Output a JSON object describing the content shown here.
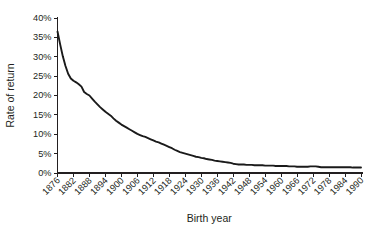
{
  "chart_data": {
    "type": "line",
    "title": "",
    "xlabel": "Birth year",
    "ylabel": "Rate of return",
    "xlim": [
      1876,
      1990
    ],
    "ylim": [
      0,
      40
    ],
    "ytick_labels": [
      "0%",
      "5%",
      "10%",
      "15%",
      "20%",
      "25%",
      "30%",
      "35%",
      "40%"
    ],
    "ytick_values": [
      0,
      5,
      10,
      15,
      20,
      25,
      30,
      35,
      40
    ],
    "xtick_labels": [
      "1876",
      "1882",
      "1888",
      "1894",
      "1900",
      "1906",
      "1912",
      "1918",
      "1924",
      "1930",
      "1936",
      "1942",
      "1948",
      "1954",
      "1960",
      "1966",
      "1972",
      "1978",
      "1984",
      "1990"
    ],
    "xtick_values": [
      1876,
      1882,
      1888,
      1894,
      1900,
      1906,
      1912,
      1918,
      1924,
      1930,
      1936,
      1942,
      1948,
      1954,
      1960,
      1966,
      1972,
      1978,
      1984,
      1990
    ],
    "grid": false,
    "legend": false,
    "line_color": "#1a1a1a",
    "x": [
      1876,
      1877,
      1878,
      1879,
      1880,
      1881,
      1882,
      1883,
      1884,
      1885,
      1886,
      1887,
      1888,
      1889,
      1890,
      1891,
      1892,
      1893,
      1894,
      1895,
      1896,
      1897,
      1898,
      1899,
      1900,
      1901,
      1902,
      1903,
      1904,
      1905,
      1906,
      1907,
      1908,
      1909,
      1910,
      1911,
      1912,
      1913,
      1914,
      1915,
      1916,
      1917,
      1918,
      1919,
      1920,
      1921,
      1922,
      1923,
      1924,
      1925,
      1926,
      1927,
      1928,
      1929,
      1930,
      1931,
      1932,
      1933,
      1934,
      1935,
      1936,
      1937,
      1938,
      1939,
      1940,
      1941,
      1942,
      1943,
      1944,
      1945,
      1946,
      1947,
      1948,
      1949,
      1950,
      1951,
      1952,
      1953,
      1954,
      1955,
      1956,
      1957,
      1958,
      1959,
      1960,
      1961,
      1962,
      1963,
      1964,
      1965,
      1966,
      1967,
      1968,
      1969,
      1970,
      1971,
      1972,
      1973,
      1974,
      1975,
      1976,
      1977,
      1978,
      1979,
      1980,
      1981,
      1982,
      1983,
      1984,
      1985,
      1986,
      1987,
      1988,
      1989,
      1990
    ],
    "y": [
      36.5,
      33.2,
      30.1,
      27.6,
      25.6,
      24.4,
      23.8,
      23.4,
      22.9,
      22.3,
      20.9,
      20.4,
      20.0,
      19.2,
      18.4,
      17.7,
      17.0,
      16.4,
      15.8,
      15.3,
      14.8,
      14.1,
      13.5,
      13.0,
      12.5,
      12.1,
      11.7,
      11.3,
      10.9,
      10.5,
      10.1,
      9.8,
      9.5,
      9.3,
      9.0,
      8.7,
      8.4,
      8.1,
      7.9,
      7.6,
      7.3,
      7.0,
      6.7,
      6.4,
      6.0,
      5.7,
      5.4,
      5.2,
      5.0,
      4.8,
      4.6,
      4.4,
      4.2,
      4.1,
      3.9,
      3.8,
      3.6,
      3.5,
      3.4,
      3.2,
      3.1,
      3.0,
      2.9,
      2.8,
      2.7,
      2.6,
      2.4,
      2.3,
      2.2,
      2.2,
      2.2,
      2.1,
      2.1,
      2.1,
      2.0,
      2.0,
      2.0,
      2.0,
      1.9,
      1.9,
      1.9,
      1.9,
      1.8,
      1.8,
      1.8,
      1.8,
      1.8,
      1.7,
      1.7,
      1.7,
      1.6,
      1.6,
      1.6,
      1.6,
      1.6,
      1.7,
      1.7,
      1.7,
      1.6,
      1.5,
      1.5,
      1.5,
      1.5,
      1.5,
      1.5,
      1.5,
      1.5,
      1.5,
      1.5,
      1.5,
      1.5,
      1.4,
      1.4,
      1.4,
      1.4
    ]
  }
}
